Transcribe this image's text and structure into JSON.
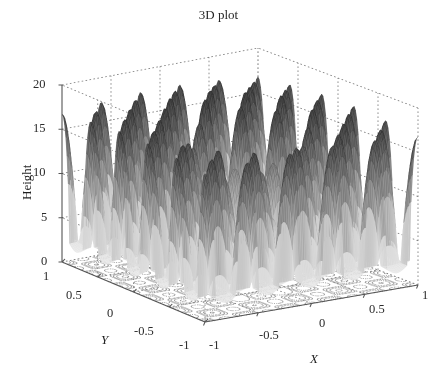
{
  "figure": {
    "title": "3D plot",
    "background": "#ffffff",
    "width": 437,
    "height": 381
  },
  "chart_data": {
    "type": "surface",
    "title": "3D plot",
    "xlabel": "X",
    "ylabel": "Y",
    "zlabel": "Height",
    "xlim": [
      -1,
      1
    ],
    "ylim": [
      -1,
      1
    ],
    "zlim": [
      0,
      20
    ],
    "xticks": [
      -1,
      -0.5,
      0,
      0.5,
      1
    ],
    "xticklabels": [
      "-1",
      "-0.5",
      "0",
      "0.5",
      "1"
    ],
    "yticks": [
      -1,
      -0.5,
      0,
      0.5,
      1
    ],
    "yticklabels": [
      "-1",
      "-0.5",
      "0",
      "0.5",
      "1"
    ],
    "zticks": [
      0,
      5,
      10,
      15,
      20
    ],
    "zticklabels": [
      "0",
      "5",
      "10",
      "15",
      "20"
    ],
    "grid": true,
    "legend": false,
    "colormap": "gray_reversed",
    "shading": "mesh",
    "projection": {
      "azimuth": -37.5,
      "elevation": 30
    },
    "contour_floor": true,
    "contour_levels": [
      2,
      5,
      9,
      13,
      17
    ],
    "surface_description": "Regular lattice of sharp conical peaks rising to about 20 units, with a deep narrow funnel descending to 0 near the centre-front of the domain",
    "peak_height_max": 20,
    "peak_height_min": 0,
    "peak_grid_spacing": 0.4,
    "valley_center": [
      -0.1,
      -0.25
    ],
    "valley_depth": 0,
    "surface_formula": "z = 10 + 10*cos(5*pi*x)*cos(5*pi*y)*exp(-2*r) style multimodal lattice with central sink"
  },
  "axes": {
    "z_label": "Height",
    "x_label": "X",
    "y_label": "Y",
    "z_ticks": [
      {
        "label": "20",
        "value": 20
      },
      {
        "label": "15",
        "value": 15
      },
      {
        "label": "10",
        "value": 10
      },
      {
        "label": "5",
        "value": 5
      },
      {
        "label": "0",
        "value": 0
      }
    ],
    "y_ticks": [
      {
        "label": "1",
        "value": 1
      },
      {
        "label": "0.5",
        "value": 0.5
      },
      {
        "label": "0",
        "value": 0
      },
      {
        "label": "-0.5",
        "value": -0.5
      },
      {
        "label": "-1",
        "value": -1
      }
    ],
    "x_ticks": [
      {
        "label": "-1",
        "value": -1
      },
      {
        "label": "-0.5",
        "value": -0.5
      },
      {
        "label": "0",
        "value": 0
      },
      {
        "label": "0.5",
        "value": 0.5
      },
      {
        "label": "1",
        "value": 1
      }
    ]
  },
  "style": {
    "axis_line_color": "#555555",
    "grid_line_color": "#777777",
    "text_color": "#2b2b2b",
    "surface_dark": "#4a4a4a",
    "surface_light": "#f2f2f2",
    "contour_color": "#8a8a8a"
  }
}
